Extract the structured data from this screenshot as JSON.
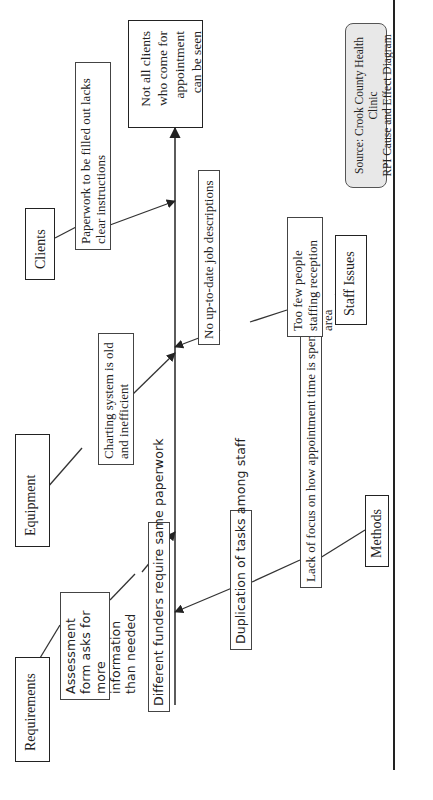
{
  "diagram": {
    "type": "cause-and-effect (fishbone)",
    "orientation": "rotated 90deg counter-clockwise",
    "effect": "Not all clients who come for appointment can be seen",
    "categories": [
      {
        "id": "requirements",
        "label": "Requirements",
        "causes": [
          "Assessment form asks for more information than needed",
          "Different funders require same paperwork"
        ]
      },
      {
        "id": "equipment",
        "label": "Equipment",
        "causes": [
          "Charting system is old and inefficient"
        ]
      },
      {
        "id": "clients",
        "label": "Clients",
        "causes": [
          "Paperwork to be filled out lacks clear instructions"
        ]
      },
      {
        "id": "methods",
        "label": "Methods",
        "causes": [
          "Duplication of tasks among staff",
          "Lack of focus on how appointment time is spent"
        ]
      },
      {
        "id": "staff",
        "label": "Staff Issues",
        "causes": [
          "No up-to-date job descriptions",
          "Too few people staffing reception area"
        ]
      }
    ],
    "source": {
      "line1": "Source:  Crook County Health Clinic",
      "line2": "RPI Cause and Effect Diagram"
    }
  }
}
